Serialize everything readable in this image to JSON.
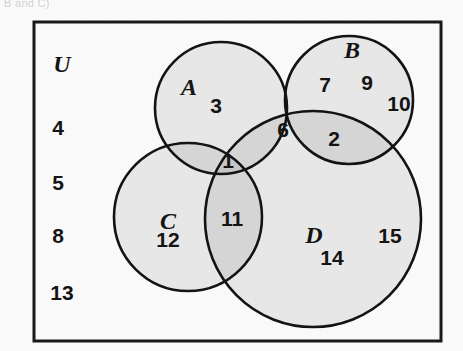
{
  "figure": {
    "type": "venn-diagram",
    "caption_fragment": "B and C)",
    "universe_label": "U",
    "set_count": 4
  },
  "frame": {
    "name": "universe-rectangle",
    "x": 34,
    "y": 22,
    "width": 407,
    "height": 319,
    "stroke_color": "#1a1a1a",
    "stroke_width": 3,
    "fill_color": "#ffffff"
  },
  "style": {
    "circle_fill": "#d9d9d9",
    "circle_stroke": "#141414",
    "circle_stroke_width": 2.6,
    "text_color": "#151515",
    "background": "#ffffff"
  },
  "sets": [
    {
      "id": "A",
      "label": "A",
      "cx": 221,
      "cy": 108,
      "r": 66,
      "label_x": 189,
      "label_y": 95
    },
    {
      "id": "B",
      "label": "B",
      "cx": 349,
      "cy": 100,
      "r": 64,
      "label_x": 352,
      "label_y": 58
    },
    {
      "id": "C",
      "label": "C",
      "cx": 188,
      "cy": 217,
      "r": 74,
      "label_x": 168,
      "label_y": 229
    },
    {
      "id": "D",
      "label": "D",
      "cx": 313,
      "cy": 219,
      "r": 108,
      "label_x": 314,
      "label_y": 243
    }
  ],
  "elements": [
    {
      "value": "3",
      "region": "A-only",
      "x": 216,
      "y": 113,
      "font_size": 21
    },
    {
      "value": "7",
      "region": "B-only",
      "x": 325,
      "y": 92,
      "font_size": 21
    },
    {
      "value": "9",
      "region": "B-only",
      "x": 367,
      "y": 90,
      "font_size": 21
    },
    {
      "value": "10",
      "region": "B-only",
      "x": 399,
      "y": 111,
      "font_size": 21
    },
    {
      "value": "6",
      "region": "A-and-B-and-D",
      "x": 283,
      "y": 137,
      "font_size": 21
    },
    {
      "value": "2",
      "region": "B-and-D",
      "x": 334,
      "y": 146,
      "font_size": 21
    },
    {
      "value": "1",
      "region": "A-and-C-and-D",
      "x": 228,
      "y": 168,
      "font_size": 21
    },
    {
      "value": "11",
      "region": "C-and-D",
      "x": 232,
      "y": 226,
      "font_size": 21
    },
    {
      "value": "12",
      "region": "C-only",
      "x": 168,
      "y": 247,
      "font_size": 21
    },
    {
      "value": "14",
      "region": "D-only",
      "x": 332,
      "y": 265,
      "font_size": 21
    },
    {
      "value": "15",
      "region": "D-only",
      "x": 390,
      "y": 243,
      "font_size": 21
    }
  ],
  "outside_elements": {
    "name": "universe-only-elements",
    "label_x": 62,
    "label_y": 72,
    "values": [
      {
        "value": "4",
        "x": 58,
        "y": 135,
        "font_size": 21
      },
      {
        "value": "5",
        "x": 58,
        "y": 190,
        "font_size": 21
      },
      {
        "value": "8",
        "x": 58,
        "y": 243,
        "font_size": 21
      },
      {
        "value": "13",
        "x": 58,
        "y": 300,
        "font_size": 21
      }
    ]
  }
}
